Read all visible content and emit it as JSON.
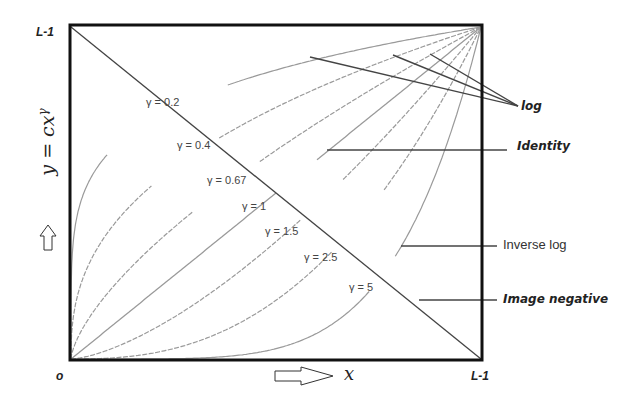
{
  "chart_data": {
    "type": "line",
    "title": "",
    "xlabel": "x",
    "ylabel": "y = cx^γ",
    "xlim": [
      0,
      1
    ],
    "ylim": [
      0,
      1
    ],
    "axis_ticks": {
      "x_min": "o",
      "x_max": "L-1",
      "y_max": "L-1"
    },
    "grid": false,
    "series": [
      {
        "name": "γ = 0.2",
        "gamma": 0.2,
        "label": "γ = 0.2"
      },
      {
        "name": "γ = 0.4",
        "gamma": 0.4,
        "label": "γ = 0.4"
      },
      {
        "name": "γ = 0.67",
        "gamma": 0.67,
        "label": "γ = 0.67"
      },
      {
        "name": "γ = 1",
        "gamma": 1,
        "label": "γ = 1"
      },
      {
        "name": "γ = 1.5",
        "gamma": 1.5,
        "label": "γ = 1.5"
      },
      {
        "name": "γ = 2.5",
        "gamma": 2.5,
        "label": "γ = 2.5"
      },
      {
        "name": "γ = 5",
        "gamma": 5,
        "label": "γ = 5"
      },
      {
        "name": "Image negative",
        "type": "line",
        "points": [
          [
            0,
            1
          ],
          [
            1,
            0
          ]
        ]
      }
    ],
    "annotations": [
      {
        "text": "log",
        "style": "italic-bold",
        "points_to": [
          "γ = 0.2",
          "γ = 0.4",
          "γ = 0.67"
        ]
      },
      {
        "text": "Identity",
        "style": "italic-bold",
        "points_to": [
          "γ = 1"
        ]
      },
      {
        "text": "Inverse log",
        "style": "plain",
        "points_to": [
          "γ = 5"
        ]
      },
      {
        "text": "Image negative",
        "style": "italic-bold",
        "points_to": [
          "Image negative"
        ]
      }
    ]
  },
  "labels": {
    "y_max": "L-1",
    "x_origin": "o",
    "x_max": "L-1",
    "y_axis_formula": "y = cx",
    "y_axis_exponent": "γ",
    "x_axis": "x",
    "log": "log",
    "identity": "Identity",
    "inverse_log": "Inverse log",
    "image_negative": "Image negative",
    "gamma_0_2": "γ = 0.2",
    "gamma_0_4": "γ = 0.4",
    "gamma_0_67": "γ = 0.67",
    "gamma_1": "γ = 1",
    "gamma_1_5": "γ = 1.5",
    "gamma_2_5": "γ = 2.5",
    "gamma_5": "γ = 5"
  },
  "icons": {
    "y_arrow": "up-arrow-icon",
    "x_arrow": "right-arrow-icon"
  },
  "colors": {
    "frame": "#111111",
    "curve": "#9a9a9a",
    "negative_line": "#444444",
    "pointer_line": "#444444",
    "text": "#222222"
  }
}
